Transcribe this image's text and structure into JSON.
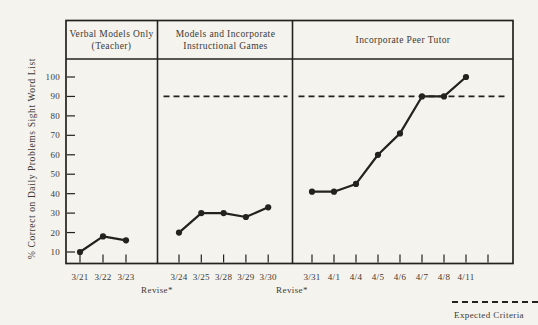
{
  "colors": {
    "background": "#f4f3ee",
    "ink": "#23221e",
    "text": "#3c3933"
  },
  "chart_data": {
    "type": "line",
    "title": "",
    "ylabel": "% Correct on Daily Problems Sight Word List",
    "yticks": [
      10,
      20,
      30,
      40,
      50,
      60,
      70,
      80,
      90,
      100
    ],
    "ylim": [
      0,
      107
    ],
    "grid": false,
    "expected_criteria": 90,
    "panels": [
      {
        "title_lines": [
          "Verbal Models Only",
          "(Teacher)"
        ],
        "x": [
          "3/21",
          "3/22",
          "3/23"
        ],
        "values": [
          10,
          18,
          16
        ],
        "criteria_line": false,
        "extra_unlabeled_ticks": 0
      },
      {
        "title_lines": [
          "Models and Incorporate",
          "Instructional Games"
        ],
        "x": [
          "3/24",
          "3/25",
          "3/28",
          "3/29",
          "3/30"
        ],
        "values": [
          20,
          30,
          30,
          28,
          33
        ],
        "criteria_line": true,
        "extra_unlabeled_ticks": 0
      },
      {
        "title_lines": [
          "Incorporate Peer Tutor"
        ],
        "x": [
          "3/31",
          "4/1",
          "4/4",
          "4/5",
          "4/6",
          "4/7",
          "4/8",
          "4/11"
        ],
        "values": [
          41,
          41,
          45,
          60,
          71,
          90,
          90,
          100
        ],
        "criteria_line": true,
        "extra_unlabeled_ticks": 1
      }
    ],
    "annotations": [
      {
        "text": "Revise*",
        "at_boundary": 1
      },
      {
        "text": "Revise*",
        "at_boundary": 2
      }
    ],
    "legend": {
      "label": "Expected Criteria",
      "style": "dashed-line",
      "position": "bottom-right"
    }
  }
}
